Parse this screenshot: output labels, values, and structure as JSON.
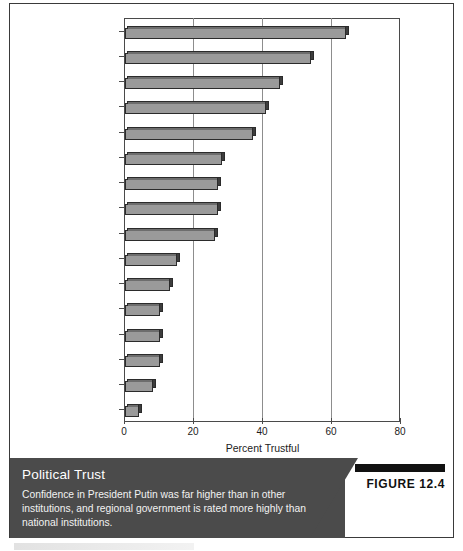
{
  "figure": {
    "tag": "FIGURE 12.4",
    "caption_title": "Political Trust",
    "caption_body": "Confidence in President Putin was far higher than in other institutions, and regional government is rated more highly than national institutions."
  },
  "chart_data": {
    "type": "bar",
    "orientation": "horizontal",
    "title": "",
    "xlabel": "Percent Trustful",
    "ylabel": "",
    "xlim": [
      0,
      80
    ],
    "xticks": [
      0,
      20,
      40,
      60,
      80
    ],
    "grid": true,
    "legend": "none",
    "categories": [
      "Putin",
      "Regional/local\ngovernment",
      "Government",
      "Church",
      "Local authorities",
      "Regional assembly",
      "Duma",
      "Federation Council",
      "Army",
      "Security organs",
      "Mass media",
      "Procuracy",
      "Trade unions",
      "Judiciary",
      "Police",
      "Traffic police"
    ],
    "values": [
      64,
      54,
      45,
      41,
      37,
      28,
      27,
      27,
      26,
      15,
      13,
      10,
      10,
      10,
      8,
      4
    ]
  },
  "colors": {
    "bar_face": "#9a9a9a",
    "bar_top": "#6d6d6d",
    "bar_side": "#3d3d3d",
    "bar_outline": "#2b2b2b",
    "caption_band": "#4b4b4b",
    "caption_text": "#ffffff",
    "figure_tag": "#111111",
    "axis": "#4a4a4a",
    "gridline": "#8d8d8d"
  }
}
